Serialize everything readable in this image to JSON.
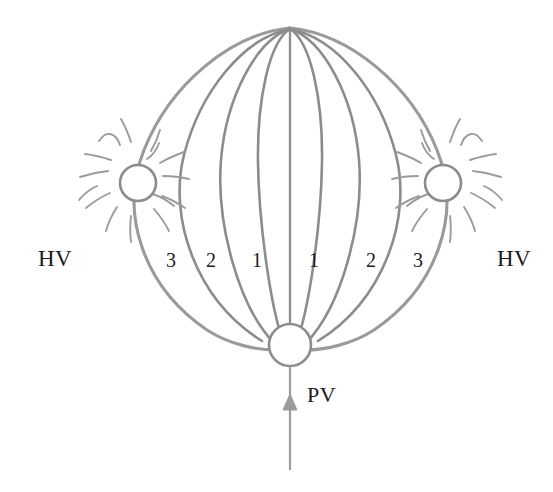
{
  "figure": {
    "title": "",
    "background_color": "#ffffff",
    "stroke_color": "#8c8c8c",
    "stroke_color_light": "#9b9b9b",
    "text_color": "#1b1b1b"
  },
  "labels": {
    "left_hv": "HV",
    "right_hv": "HV",
    "pv": "PV"
  },
  "ribs": [
    {
      "label": "3",
      "x": 172,
      "y": 262
    },
    {
      "label": "2",
      "x": 212,
      "y": 262
    },
    {
      "label": "1",
      "x": 258,
      "y": 262
    },
    {
      "label": "1",
      "x": 315,
      "y": 262
    },
    {
      "label": "2",
      "x": 372,
      "y": 262
    },
    {
      "label": "3",
      "x": 419,
      "y": 262
    }
  ],
  "nodes": [
    {
      "name": "left-hv-node",
      "cx": 138,
      "cy": 183,
      "r": 18
    },
    {
      "name": "right-hv-node",
      "cx": 443,
      "cy": 183,
      "r": 18
    },
    {
      "name": "pv-node",
      "cx": 290,
      "cy": 345,
      "r": 21
    }
  ],
  "arrow": {
    "label": "PV",
    "x": 290,
    "tail_y": 470,
    "head_y": 396,
    "direction": "up"
  }
}
